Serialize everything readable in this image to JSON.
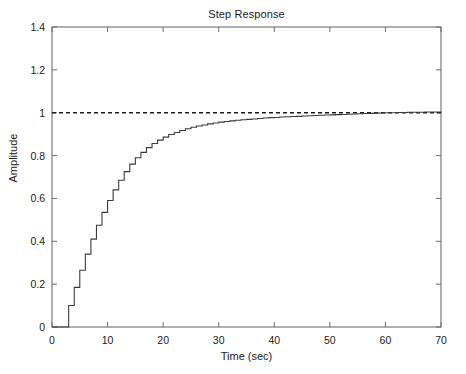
{
  "chart_data": {
    "type": "line",
    "title": "Step Response",
    "xlabel": "Time (sec)",
    "ylabel": "Amplitude",
    "xlim": [
      0,
      70
    ],
    "ylim": [
      0,
      1.4
    ],
    "xticks": [
      0,
      10,
      20,
      30,
      40,
      50,
      60,
      70
    ],
    "xtick_labels": [
      "0",
      "10",
      "20",
      "30",
      "40",
      "50",
      "60",
      "70"
    ],
    "yticks": [
      0,
      0.2,
      0.4,
      0.6,
      0.8,
      1,
      1.2,
      1.4
    ],
    "ytick_labels": [
      "0",
      "0.2",
      "0.4",
      "0.6",
      "0.8",
      "1",
      "1.2",
      "1.4"
    ],
    "grid": false,
    "legend": null,
    "line_color": "#3c3c3c",
    "reference_color": "#1a1a1a",
    "axis_color": "#6e6e6e",
    "background": "#ffffff",
    "series": [
      {
        "name": "step response",
        "style": "staircase",
        "x": [
          0,
          1,
          2,
          3,
          4,
          5,
          6,
          7,
          8,
          9,
          10,
          11,
          12,
          13,
          14,
          15,
          16,
          17,
          18,
          19,
          20,
          21,
          22,
          23,
          24,
          25,
          26,
          27,
          28,
          29,
          30,
          31,
          32,
          33,
          34,
          35,
          36,
          37,
          38,
          39,
          40,
          41,
          42,
          43,
          44,
          45,
          46,
          47,
          48,
          49,
          50,
          51,
          52,
          53,
          54,
          55,
          56,
          57,
          58,
          59,
          60,
          61,
          62,
          63,
          64,
          65,
          66,
          67,
          68,
          69,
          70
        ],
        "values": [
          0,
          0,
          0,
          0.1,
          0.185,
          0.265,
          0.34,
          0.41,
          0.475,
          0.535,
          0.59,
          0.64,
          0.685,
          0.725,
          0.76,
          0.79,
          0.815,
          0.837,
          0.856,
          0.872,
          0.886,
          0.898,
          0.908,
          0.917,
          0.925,
          0.932,
          0.938,
          0.943,
          0.948,
          0.952,
          0.956,
          0.959,
          0.962,
          0.965,
          0.967,
          0.969,
          0.971,
          0.973,
          0.975,
          0.977,
          0.978,
          0.98,
          0.981,
          0.982,
          0.983,
          0.985,
          0.986,
          0.987,
          0.988,
          0.989,
          0.99,
          0.991,
          0.992,
          0.993,
          0.994,
          0.995,
          0.996,
          0.997,
          0.998,
          0.999,
          1.0,
          1.0,
          1.001,
          1.001,
          1.002,
          1.002,
          1.002,
          1.003,
          1.003,
          1.003,
          1.004
        ]
      },
      {
        "name": "steady-state reference",
        "style": "dashed",
        "x": [
          0,
          70
        ],
        "values": [
          1.0,
          1.0
        ]
      }
    ],
    "annotations": []
  }
}
